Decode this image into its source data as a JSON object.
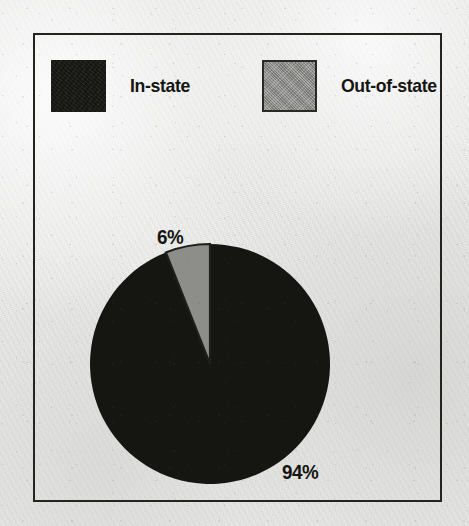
{
  "figure": {
    "background_color": "#ececeb",
    "frame_color": "#24241f"
  },
  "legend": {
    "items": [
      {
        "label": "In-state",
        "swatch": "legend-swatch-dark",
        "color": "#151512"
      },
      {
        "label": "Out-of-state",
        "swatch": "legend-swatch-gray",
        "color": "#8d8d8a"
      }
    ]
  },
  "chart_data": {
    "type": "pie",
    "title": "",
    "subtitle": "",
    "xlabel": "",
    "ylabel": "",
    "grid": false,
    "legend_position": "top",
    "start_angle_deg": 0,
    "direction": "counterclockwise",
    "categories": [
      "In-state",
      "Out-of-state"
    ],
    "values": [
      94,
      6
    ],
    "units": "%",
    "data_labels": [
      "94%",
      "6%"
    ],
    "colors": [
      "#151512",
      "#8d8d8a"
    ],
    "slices": [
      {
        "name": "In-state",
        "value": 94,
        "label": "94%",
        "color": "#151512"
      },
      {
        "name": "Out-of-state",
        "value": 6,
        "label": "6%",
        "color": "#8d8d8a"
      }
    ]
  }
}
